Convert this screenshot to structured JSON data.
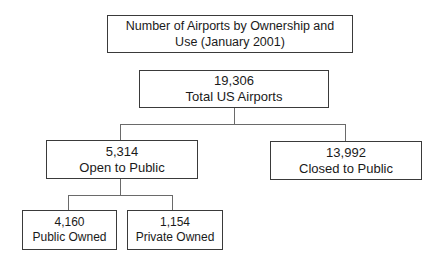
{
  "diagram": {
    "title": {
      "line1": "Number of Airports by Ownership and",
      "line2": "Use (January 2001)"
    },
    "root": {
      "value": "19,306",
      "label": "Total US Airports"
    },
    "level1": [
      {
        "value": "5,314",
        "label": "Open to Public"
      },
      {
        "value": "13,992",
        "label": "Closed to Public"
      }
    ],
    "level2": [
      {
        "value": "4,160",
        "label": "Public Owned"
      },
      {
        "value": "1,154",
        "label": "Private Owned"
      }
    ]
  }
}
